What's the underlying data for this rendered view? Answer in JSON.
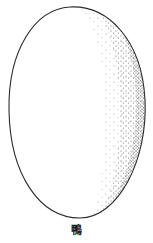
{
  "figure": {
    "caption": "鴨",
    "outline_color": "#2a2a2a",
    "stipple_color": "#555555",
    "background": "#ffffff"
  }
}
